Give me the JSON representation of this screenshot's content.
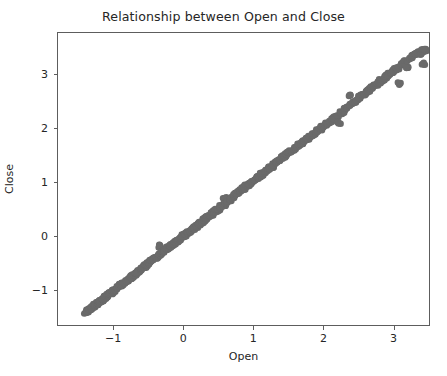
{
  "figure": {
    "width": 447,
    "height": 376,
    "background_color": "#ffffff",
    "axes_edge_color": "#5d5d5d",
    "text_color": "#262626"
  },
  "chart_data": {
    "type": "scatter",
    "title": "Relationship between Open and Close",
    "xlabel": "Open",
    "ylabel": "Close",
    "grid": false,
    "legend": null,
    "marker_color": "#6a6a6a",
    "marker_size_px": 6.5,
    "marker_opacity": 1.0,
    "xlim": [
      -1.8,
      3.52
    ],
    "ylim": [
      -1.67,
      3.78
    ],
    "xticks": [
      -1,
      0,
      1,
      2,
      3
    ],
    "xticklabels": [
      "−1",
      "0",
      "1",
      "2",
      "3"
    ],
    "yticks": [
      -1,
      0,
      1,
      2,
      3
    ],
    "yticklabels": [
      "−1",
      "0",
      "1",
      "2",
      "3"
    ],
    "relationship": "near-perfect positive linear correlation, Close ≈ Open",
    "points": [
      [
        -1.4,
        -1.44
      ],
      [
        -1.38,
        -1.42
      ],
      [
        -1.37,
        -1.41
      ],
      [
        -1.36,
        -1.4
      ],
      [
        -1.35,
        -1.39
      ],
      [
        -1.34,
        -1.37
      ],
      [
        -1.33,
        -1.36
      ],
      [
        -1.32,
        -1.35
      ],
      [
        -1.31,
        -1.34
      ],
      [
        -1.3,
        -1.33
      ],
      [
        -1.29,
        -1.32
      ],
      [
        -1.28,
        -1.31
      ],
      [
        -1.27,
        -1.3
      ],
      [
        -1.26,
        -1.29
      ],
      [
        -1.25,
        -1.28
      ],
      [
        -1.24,
        -1.27
      ],
      [
        -1.23,
        -1.26
      ],
      [
        -1.22,
        -1.25
      ],
      [
        -1.21,
        -1.24
      ],
      [
        -1.2,
        -1.23
      ],
      [
        -1.19,
        -1.22
      ],
      [
        -1.18,
        -1.21
      ],
      [
        -1.17,
        -1.2
      ],
      [
        -1.16,
        -1.19
      ],
      [
        -1.15,
        -1.18
      ],
      [
        -1.14,
        -1.17
      ],
      [
        -1.13,
        -1.16
      ],
      [
        -1.12,
        -1.15
      ],
      [
        -1.11,
        -1.14
      ],
      [
        -1.1,
        -1.13
      ],
      [
        -1.08,
        -1.11
      ],
      [
        -1.06,
        -1.09
      ],
      [
        -1.04,
        -1.07
      ],
      [
        -1.02,
        -1.05
      ],
      [
        -1.0,
        -1.03
      ],
      [
        -0.98,
        -1.01
      ],
      [
        -0.96,
        -0.99
      ],
      [
        -0.94,
        -0.97
      ],
      [
        -0.92,
        -0.95
      ],
      [
        -0.9,
        -0.93
      ],
      [
        -0.88,
        -0.91
      ],
      [
        -0.86,
        -0.89
      ],
      [
        -0.84,
        -0.87
      ],
      [
        -0.82,
        -0.85
      ],
      [
        -0.8,
        -0.83
      ],
      [
        -0.78,
        -0.81
      ],
      [
        -0.76,
        -0.79
      ],
      [
        -0.74,
        -0.77
      ],
      [
        -0.72,
        -0.74
      ],
      [
        -0.7,
        -0.72
      ],
      [
        -0.68,
        -0.7
      ],
      [
        -0.66,
        -0.68
      ],
      [
        -0.64,
        -0.66
      ],
      [
        -0.62,
        -0.64
      ],
      [
        -0.6,
        -0.62
      ],
      [
        -0.58,
        -0.6
      ],
      [
        -0.56,
        -0.58
      ],
      [
        -0.54,
        -0.56
      ],
      [
        -0.52,
        -0.54
      ],
      [
        -0.5,
        -0.52
      ],
      [
        -0.48,
        -0.5
      ],
      [
        -0.46,
        -0.48
      ],
      [
        -0.44,
        -0.46
      ],
      [
        -0.42,
        -0.44
      ],
      [
        -0.4,
        -0.42
      ],
      [
        -0.38,
        -0.39
      ],
      [
        -0.36,
        -0.37
      ],
      [
        -0.34,
        -0.35
      ],
      [
        -0.33,
        -0.2
      ],
      [
        -0.32,
        -0.33
      ],
      [
        -0.3,
        -0.31
      ],
      [
        -0.28,
        -0.29
      ],
      [
        -0.26,
        -0.27
      ],
      [
        -0.24,
        -0.25
      ],
      [
        -0.22,
        -0.23
      ],
      [
        -0.2,
        -0.21
      ],
      [
        -0.18,
        -0.19
      ],
      [
        -0.16,
        -0.17
      ],
      [
        -0.14,
        -0.15
      ],
      [
        -0.12,
        -0.13
      ],
      [
        -0.1,
        -0.11
      ],
      [
        -0.08,
        -0.09
      ],
      [
        -0.06,
        -0.07
      ],
      [
        -0.04,
        -0.05
      ],
      [
        -0.02,
        -0.03
      ],
      [
        0.0,
        -0.01
      ],
      [
        0.02,
        0.01
      ],
      [
        0.04,
        0.03
      ],
      [
        0.06,
        0.05
      ],
      [
        0.08,
        0.07
      ],
      [
        0.1,
        0.09
      ],
      [
        0.12,
        0.11
      ],
      [
        0.14,
        0.13
      ],
      [
        0.16,
        0.15
      ],
      [
        0.18,
        0.17
      ],
      [
        0.2,
        0.19
      ],
      [
        0.22,
        0.21
      ],
      [
        0.24,
        0.23
      ],
      [
        0.26,
        0.25
      ],
      [
        0.28,
        0.27
      ],
      [
        0.3,
        0.29
      ],
      [
        0.32,
        0.31
      ],
      [
        0.34,
        0.33
      ],
      [
        0.36,
        0.36
      ],
      [
        0.38,
        0.38
      ],
      [
        0.4,
        0.4
      ],
      [
        0.42,
        0.42
      ],
      [
        0.44,
        0.44
      ],
      [
        0.46,
        0.46
      ],
      [
        0.48,
        0.48
      ],
      [
        0.5,
        0.5
      ],
      [
        0.52,
        0.52
      ],
      [
        0.54,
        0.54
      ],
      [
        0.56,
        0.56
      ],
      [
        0.58,
        0.58
      ],
      [
        0.59,
        0.7
      ],
      [
        0.6,
        0.6
      ],
      [
        0.62,
        0.62
      ],
      [
        0.64,
        0.64
      ],
      [
        0.66,
        0.67
      ],
      [
        0.68,
        0.69
      ],
      [
        0.7,
        0.72
      ],
      [
        0.72,
        0.74
      ],
      [
        0.74,
        0.76
      ],
      [
        0.76,
        0.78
      ],
      [
        0.78,
        0.8
      ],
      [
        0.8,
        0.82
      ],
      [
        0.82,
        0.84
      ],
      [
        0.84,
        0.86
      ],
      [
        0.86,
        0.88
      ],
      [
        0.88,
        0.9
      ],
      [
        0.9,
        0.92
      ],
      [
        0.92,
        0.94
      ],
      [
        0.94,
        0.96
      ],
      [
        0.96,
        0.98
      ],
      [
        0.98,
        1.0
      ],
      [
        1.0,
        1.02
      ],
      [
        1.03,
        1.05
      ],
      [
        1.06,
        1.08
      ],
      [
        1.09,
        1.11
      ],
      [
        1.12,
        1.14
      ],
      [
        1.15,
        1.17
      ],
      [
        1.18,
        1.2
      ],
      [
        1.21,
        1.23
      ],
      [
        1.24,
        1.26
      ],
      [
        1.27,
        1.29
      ],
      [
        1.3,
        1.32
      ],
      [
        1.33,
        1.36
      ],
      [
        1.36,
        1.39
      ],
      [
        1.39,
        1.42
      ],
      [
        1.42,
        1.45
      ],
      [
        1.45,
        1.48
      ],
      [
        1.48,
        1.51
      ],
      [
        1.51,
        1.54
      ],
      [
        1.54,
        1.57
      ],
      [
        1.57,
        1.6
      ],
      [
        1.6,
        1.63
      ],
      [
        1.63,
        1.66
      ],
      [
        1.66,
        1.69
      ],
      [
        1.69,
        1.72
      ],
      [
        1.72,
        1.75
      ],
      [
        1.75,
        1.78
      ],
      [
        1.78,
        1.81
      ],
      [
        1.81,
        1.84
      ],
      [
        1.84,
        1.87
      ],
      [
        1.87,
        1.9
      ],
      [
        1.9,
        1.93
      ],
      [
        1.93,
        1.96
      ],
      [
        1.96,
        1.99
      ],
      [
        1.99,
        2.02
      ],
      [
        2.02,
        2.05
      ],
      [
        2.05,
        2.08
      ],
      [
        2.08,
        2.11
      ],
      [
        2.11,
        2.14
      ],
      [
        2.14,
        2.17
      ],
      [
        2.17,
        2.2
      ],
      [
        2.2,
        2.23
      ],
      [
        2.23,
        2.1
      ],
      [
        2.26,
        2.29
      ],
      [
        2.29,
        2.32
      ],
      [
        2.32,
        2.36
      ],
      [
        2.35,
        2.39
      ],
      [
        2.38,
        2.62
      ],
      [
        2.41,
        2.45
      ],
      [
        2.44,
        2.48
      ],
      [
        2.47,
        2.51
      ],
      [
        2.5,
        2.55
      ],
      [
        2.53,
        2.58
      ],
      [
        2.56,
        2.61
      ],
      [
        2.59,
        2.64
      ],
      [
        2.62,
        2.67
      ],
      [
        2.65,
        2.7
      ],
      [
        2.68,
        2.73
      ],
      [
        2.71,
        2.76
      ],
      [
        2.74,
        2.79
      ],
      [
        2.77,
        2.82
      ],
      [
        2.8,
        2.86
      ],
      [
        2.83,
        2.89
      ],
      [
        2.86,
        2.92
      ],
      [
        2.89,
        2.95
      ],
      [
        2.92,
        2.98
      ],
      [
        2.95,
        3.01
      ],
      [
        2.98,
        3.04
      ],
      [
        3.01,
        3.07
      ],
      [
        3.04,
        3.1
      ],
      [
        3.07,
        3.13
      ],
      [
        3.1,
        2.83
      ],
      [
        3.13,
        3.19
      ],
      [
        3.16,
        3.22
      ],
      [
        3.19,
        3.25
      ],
      [
        3.22,
        3.13
      ],
      [
        3.25,
        3.31
      ],
      [
        3.28,
        3.34
      ],
      [
        3.31,
        3.37
      ],
      [
        3.34,
        3.4
      ],
      [
        3.37,
        3.43
      ],
      [
        3.4,
        3.39
      ],
      [
        3.42,
        3.45
      ],
      [
        3.44,
        3.2
      ],
      [
        3.46,
        3.47
      ]
    ]
  }
}
